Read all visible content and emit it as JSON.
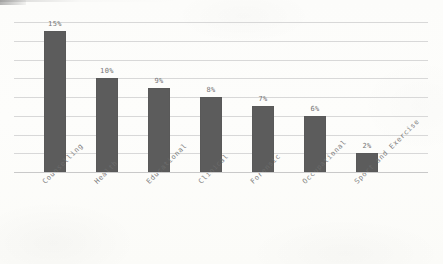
{
  "chart_data": {
    "type": "bar",
    "title": "",
    "subtitle": "",
    "xlabel": "",
    "ylabel": "",
    "categories": [
      "Counselling",
      "Health",
      "Educational",
      "Clinical",
      "Forensic",
      "Occupational",
      "Sport and Exercise"
    ],
    "values": [
      15,
      10,
      9,
      8,
      7,
      6,
      2
    ],
    "value_labels": [
      "15%",
      "10%",
      "9%",
      "8%",
      "7%",
      "6%",
      "2%"
    ],
    "unit": "%",
    "ylim": [
      0,
      16
    ],
    "ytick_values": [
      0,
      2,
      4,
      6,
      8,
      10,
      12,
      14,
      16
    ],
    "ytick_labels": [],
    "grid": true,
    "grid_axis": "y",
    "legend": false,
    "legend_position": "none",
    "bar_color": "#5c5c5c",
    "grid_color": "#d8d8d8",
    "axis_color": "#c9c9c9",
    "label_color": "#6b6b6b",
    "background_color": "#fdfdfb",
    "xtick_rotation": -45
  },
  "figure": {
    "paper_style": "scanned-document",
    "has_border": false
  }
}
